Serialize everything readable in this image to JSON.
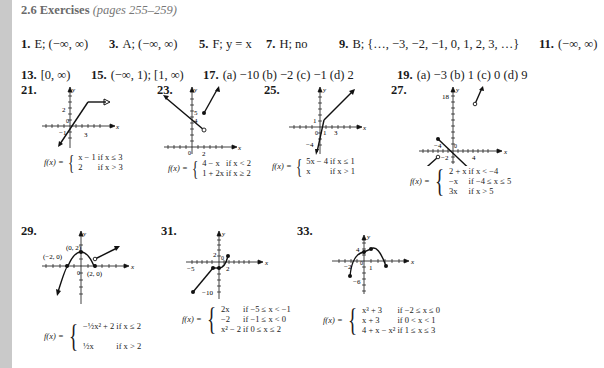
{
  "title": {
    "section": "2.6 Exercises",
    "pages": "(pages 255–259)"
  },
  "answers_row1": [
    {
      "num": "1.",
      "text": "E; (−∞, ∞)",
      "x": 0
    },
    {
      "num": "3.",
      "text": "A; (−∞, ∞)",
      "x": 88
    },
    {
      "num": "5.",
      "text": "F; y = x",
      "x": 178
    },
    {
      "num": "7.",
      "text": "H; no",
      "x": 245
    },
    {
      "num": "9.",
      "text": "B; {…, −3, −2, −1, 0, 1, 2, 3, …}",
      "x": 318
    },
    {
      "num": "11.",
      "text": "(−∞, ∞)",
      "x": 518
    }
  ],
  "answers_row2": [
    {
      "num": "13.",
      "text": "[0, ∞)",
      "x": 0
    },
    {
      "num": "15.",
      "text": "(−∞, 1); [1, ∞)",
      "x": 70
    },
    {
      "num": "17.",
      "text": "(a) −10  (b) −2  (c) −1  (d) 2",
      "x": 182
    },
    {
      "num": "19.",
      "text": "(a) −3  (b) 1  (c) 0  (d) 9",
      "x": 376
    }
  ],
  "figures": [
    {
      "num": "21.",
      "formula_lhs": "f(x) =",
      "pieces": [
        [
          "x − 1",
          "if x ≤ 3"
        ],
        [
          "2",
          "if x > 3"
        ]
      ],
      "labels": {
        "y": "y",
        "x": "x",
        "t1": "2",
        "t2": "0",
        "t3": "−1",
        "t4": "3"
      }
    },
    {
      "num": "23.",
      "formula_lhs": "f(x) =",
      "pieces": [
        [
          "4 − x",
          "if x < 2"
        ],
        [
          "1 + 2x",
          "if x ≥ 2"
        ]
      ],
      "labels": {
        "y": "y",
        "x": "x",
        "t1": "5",
        "t2": "4",
        "t3": "0",
        "t4": "2"
      }
    },
    {
      "num": "25.",
      "formula_lhs": "f(x) =",
      "pieces": [
        [
          "5x − 4",
          "if x ≤ 1"
        ],
        [
          "x",
          "if x > 1"
        ]
      ],
      "labels": {
        "y": "y",
        "x": "x",
        "t1": "1",
        "t2": "0",
        "t3": "1",
        "t4": "3",
        "t5": "−4"
      }
    },
    {
      "num": "27.",
      "formula_lhs": "f(x) =",
      "pieces": [
        [
          "2 + x",
          "if x < −4"
        ],
        [
          "−x",
          "if −4 ≤ x ≤ 5"
        ],
        [
          "3x",
          "if x > 5"
        ]
      ],
      "labels": {
        "y": "y",
        "x": "x",
        "t1": "18",
        "t2": "−4",
        "t3": "0",
        "t4": "−2",
        "t5": "4"
      }
    },
    {
      "num": "29.",
      "formula_lhs": "f(x) =",
      "pieces": [
        [
          "−½x² + 2",
          "if x ≤ 2"
        ],
        [
          "½x",
          "if x > 2"
        ]
      ],
      "labels": {
        "y": "y",
        "x": "x",
        "p1": "(0, 2)",
        "p2": "(−2, 0)",
        "p3": "(2, 0)",
        "t0": "0"
      }
    },
    {
      "num": "31.",
      "formula_lhs": "f(x) =",
      "pieces": [
        [
          "2x",
          "if −5 ≤ x < −1"
        ],
        [
          "−2",
          "if −1 ≤ x < 0"
        ],
        [
          "x² − 2",
          "if 0 ≤ x ≤ 2"
        ]
      ],
      "labels": {
        "y": "y",
        "x": "x",
        "t1": "2",
        "t2": "0",
        "t3": "−5",
        "t4": "2",
        "t5": "−10"
      }
    },
    {
      "num": "33.",
      "formula_lhs": "f(x) =",
      "pieces": [
        [
          "x³ + 3",
          "if −2 ≤ x ≤ 0"
        ],
        [
          "x + 3",
          "if 0 < x < 1"
        ],
        [
          "4 + x − x²",
          "if 1 ≤ x ≤ 3"
        ]
      ],
      "labels": {
        "y": "y",
        "x": "x",
        "t1": "4",
        "t2": "−2",
        "t3": "0",
        "t4": "1",
        "t5": "−6"
      }
    }
  ]
}
